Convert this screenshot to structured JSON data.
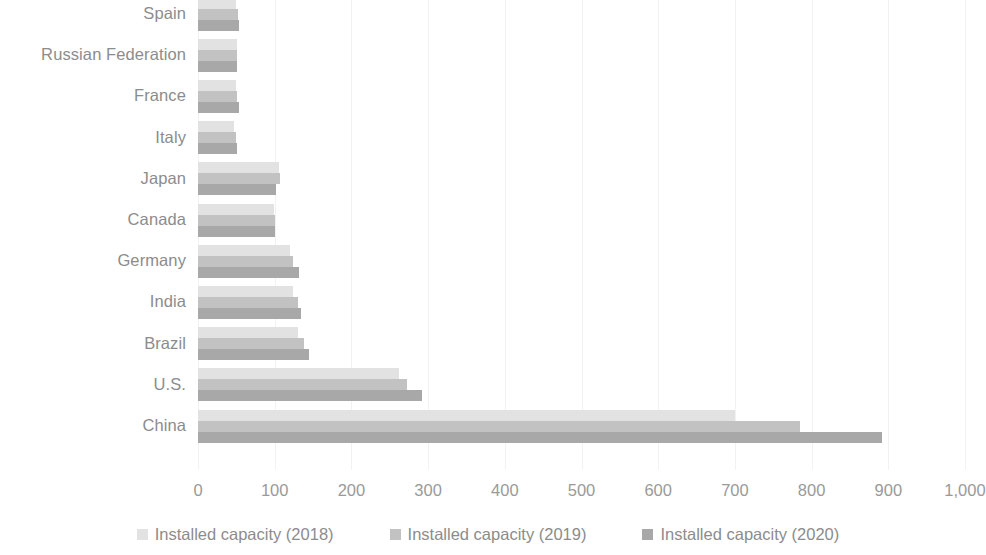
{
  "chart_data": {
    "type": "bar",
    "orientation": "horizontal",
    "title": "",
    "subtitle": "",
    "xlabel": "",
    "ylabel": "",
    "xlim": [
      0,
      1000
    ],
    "xticks": [
      0,
      100,
      200,
      300,
      400,
      500,
      600,
      700,
      800,
      900,
      1000
    ],
    "xtick_labels": [
      "0",
      "100",
      "200",
      "300",
      "400",
      "500",
      "600",
      "700",
      "800",
      "900",
      "1,000"
    ],
    "grid": true,
    "grid_axis": "x",
    "legend_position": "bottom",
    "categories": [
      "Spain",
      "Russian Federation",
      "France",
      "Italy",
      "Japan",
      "Canada",
      "Germany",
      "India",
      "Brazil",
      "U.S.",
      "China"
    ],
    "series": [
      {
        "name": "Installed capacity (2018)",
        "color": "#e2e2e2",
        "values": [
          50,
          51,
          49,
          47,
          105,
          99,
          120,
          124,
          130,
          262,
          700
        ]
      },
      {
        "name": "Installed capacity (2019)",
        "color": "#c2c2c2",
        "values": [
          52,
          51,
          51,
          50,
          107,
          101,
          124,
          131,
          138,
          273,
          785
        ]
      },
      {
        "name": "Installed capacity (2020)",
        "color": "#a8a8a8",
        "values": [
          53,
          51,
          53,
          51,
          102,
          101,
          132,
          134,
          145,
          292,
          892
        ]
      }
    ]
  },
  "legend": {
    "items": [
      {
        "label": "Installed capacity (2018)",
        "color": "#e2e2e2"
      },
      {
        "label": "Installed capacity (2019)",
        "color": "#c2c2c2"
      },
      {
        "label": "Installed capacity (2020)",
        "color": "#a8a8a8"
      }
    ]
  },
  "colors": {
    "series_2018": "#e2e2e2",
    "series_2019": "#c2c2c2",
    "series_2020": "#a8a8a8",
    "gridline": "#f2f2f2",
    "text": "#8c8c8c",
    "background": "#ffffff"
  }
}
